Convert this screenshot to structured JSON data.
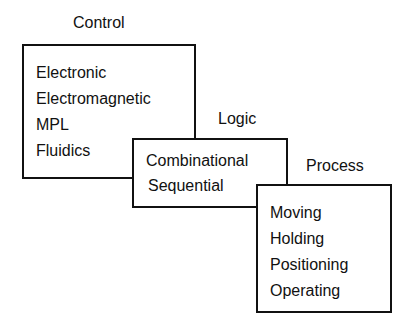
{
  "diagram": {
    "control": {
      "title": "Control",
      "items": [
        "Electronic",
        "Electromagnetic",
        "MPL",
        "Fluidics"
      ]
    },
    "logic": {
      "title": "Logic",
      "items": [
        "Combinational",
        "Sequential"
      ]
    },
    "process": {
      "title": "Process",
      "items": [
        "Moving",
        "Holding",
        "Positioning",
        "Operating"
      ]
    }
  }
}
